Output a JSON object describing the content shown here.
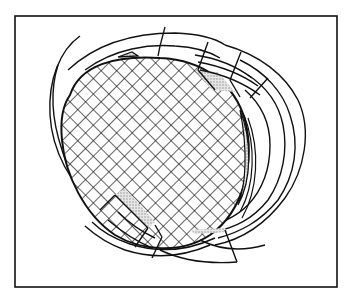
{
  "diagram": {
    "title": "",
    "colors": {
      "ink": "#111111",
      "background": "#ffffff",
      "stipple": "#bdbdbd"
    },
    "frame": {
      "x": 15,
      "y": 16,
      "width": 322,
      "height": 271
    },
    "elements": [
      {
        "name": "cross-hatched-core",
        "type": "oval",
        "pattern": "diagonal-grid"
      },
      {
        "name": "concentric-bands",
        "count": 4
      },
      {
        "name": "upper-right-break-zone",
        "stippled": true
      },
      {
        "name": "lower-left-break-zone",
        "stippled": true
      },
      {
        "name": "right-side-stippled-rim",
        "stippled": true
      }
    ]
  }
}
